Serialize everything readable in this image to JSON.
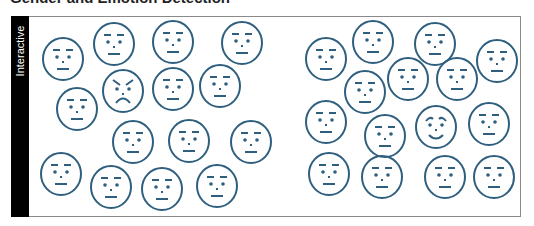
{
  "title": "Gender and Emotion Detection",
  "sidebar": {
    "label": "Interactive"
  },
  "colors": {
    "face_stroke": "#2f5f7f",
    "sidebar_bg": "#000000",
    "frame_border": "#8a8a8a"
  },
  "groups": [
    {
      "name": "left-group",
      "faces": [
        {
          "cx": 63,
          "cy": 59,
          "expr": "neutral"
        },
        {
          "cx": 114,
          "cy": 44,
          "expr": "neutral"
        },
        {
          "cx": 173,
          "cy": 42,
          "expr": "neutral"
        },
        {
          "cx": 242,
          "cy": 43,
          "expr": "neutral"
        },
        {
          "cx": 77,
          "cy": 109,
          "expr": "neutral"
        },
        {
          "cx": 123,
          "cy": 91,
          "expr": "angry"
        },
        {
          "cx": 173,
          "cy": 89,
          "expr": "neutral"
        },
        {
          "cx": 220,
          "cy": 86,
          "expr": "neutral"
        },
        {
          "cx": 133,
          "cy": 142,
          "expr": "neutral"
        },
        {
          "cx": 189,
          "cy": 141,
          "expr": "neutral"
        },
        {
          "cx": 251,
          "cy": 142,
          "expr": "neutral"
        },
        {
          "cx": 61,
          "cy": 174,
          "expr": "neutral"
        },
        {
          "cx": 111,
          "cy": 187,
          "expr": "neutral"
        },
        {
          "cx": 162,
          "cy": 189,
          "expr": "neutral"
        },
        {
          "cx": 217,
          "cy": 186,
          "expr": "neutral"
        }
      ]
    },
    {
      "name": "right-group",
      "faces": [
        {
          "cx": 326,
          "cy": 59,
          "expr": "neutral"
        },
        {
          "cx": 373,
          "cy": 42,
          "expr": "neutral"
        },
        {
          "cx": 435,
          "cy": 44,
          "expr": "neutral"
        },
        {
          "cx": 497,
          "cy": 61,
          "expr": "neutral"
        },
        {
          "cx": 365,
          "cy": 92,
          "expr": "neutral"
        },
        {
          "cx": 408,
          "cy": 79,
          "expr": "neutral"
        },
        {
          "cx": 457,
          "cy": 79,
          "expr": "neutral"
        },
        {
          "cx": 326,
          "cy": 122,
          "expr": "neutral"
        },
        {
          "cx": 385,
          "cy": 136,
          "expr": "neutral"
        },
        {
          "cx": 436,
          "cy": 127,
          "expr": "happy"
        },
        {
          "cx": 489,
          "cy": 124,
          "expr": "neutral"
        },
        {
          "cx": 329,
          "cy": 174,
          "expr": "neutral"
        },
        {
          "cx": 382,
          "cy": 177,
          "expr": "neutral"
        },
        {
          "cx": 445,
          "cy": 177,
          "expr": "neutral"
        },
        {
          "cx": 494,
          "cy": 177,
          "expr": "neutral"
        }
      ]
    }
  ]
}
